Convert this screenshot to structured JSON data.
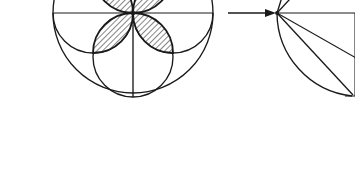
{
  "figure": {
    "background_color": "#ffffff",
    "ink_color": "#1a1a1a",
    "hatch_color": "#2b2b2b",
    "canvas": {
      "width": 355,
      "height": 177
    }
  },
  "left_figure": {
    "name": "four-petal rosette in circle",
    "center": {
      "x": 133,
      "y": 13
    },
    "outer_circle": {
      "cx": 133,
      "cy": 13,
      "r": 80
    },
    "inner_circle": {
      "cx": 133,
      "cy": 57,
      "r": 40
    },
    "horizontal_diameter": {
      "x1": 53,
      "y1": 13,
      "x2": 213,
      "y2": 13
    },
    "vertical_radius": {
      "x1": 133,
      "y1": 13,
      "x2": 133,
      "y2": 97
    },
    "side_arc_left": {
      "cx": 93,
      "cy": 13,
      "r": 40
    },
    "side_arc_right": {
      "cx": 173,
      "cy": 13,
      "r": 40
    },
    "petals": [
      {
        "id": "petal-lower-left",
        "shaded": true,
        "hatched": true
      },
      {
        "id": "petal-lower-right",
        "shaded": true,
        "hatched": true
      },
      {
        "id": "petal-upper-left",
        "shaded": true,
        "hatched": true
      },
      {
        "id": "petal-upper-right",
        "shaded": true,
        "hatched": true
      }
    ],
    "petal_count": 4,
    "hatch_angle_degrees": 45
  },
  "arrow": {
    "name": "transformation arrow",
    "direction": "right",
    "x1": 228,
    "y1": 13,
    "x2": 274,
    "y2": 13
  },
  "right_figure": {
    "name": "sector with radiating chords",
    "vertex": {
      "x": 277,
      "y": 13
    },
    "horizontal_edge": {
      "x1": 277,
      "y1": 13,
      "x2": 355,
      "y2": 13
    },
    "arc": {
      "cx": 277,
      "cy": 13,
      "r": 84,
      "from_degrees": 0,
      "to_degrees": 90
    },
    "diagonal_chord": {
      "x1": 277,
      "y1": 13,
      "x2": 352,
      "y2": 95
    },
    "radiating_lines": [
      {
        "id": "ray-up-steep",
        "angle_degrees": -72
      },
      {
        "id": "ray-up-shallow",
        "angle_degrees": -38
      },
      {
        "id": "ray-horizontal",
        "angle_degrees": 0
      },
      {
        "id": "ray-down-shallow",
        "angle_degrees": 30
      },
      {
        "id": "ray-down-steep",
        "angle_degrees": 47
      }
    ],
    "corner_point": {
      "x": 352,
      "y": 95
    }
  }
}
